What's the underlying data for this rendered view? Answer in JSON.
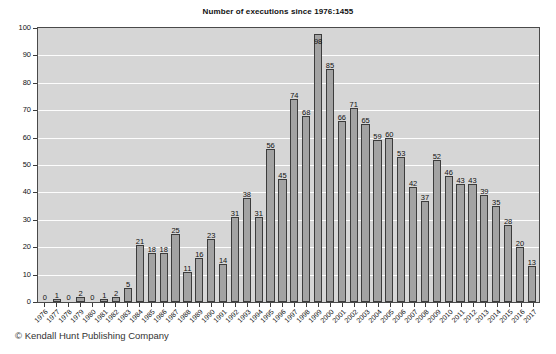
{
  "chart_data": {
    "type": "bar",
    "title": "Number of executions since 1976:1455",
    "xlabel": "",
    "ylabel": "",
    "ylim": [
      0,
      100
    ],
    "yticks": [
      0,
      10,
      20,
      30,
      40,
      50,
      60,
      70,
      80,
      90,
      100
    ],
    "grid": true,
    "legend": null,
    "categories": [
      "1976",
      "1977",
      "1978",
      "1979",
      "1980",
      "1981",
      "1982",
      "1983",
      "1984",
      "1985",
      "1986",
      "1987",
      "1988",
      "1989",
      "1990",
      "1991",
      "1992",
      "1993",
      "1994",
      "1995",
      "1996",
      "1997",
      "1998",
      "1999",
      "2000",
      "2001",
      "2002",
      "2003",
      "2004",
      "2005",
      "2006",
      "2007",
      "2008",
      "2009",
      "2010",
      "2011",
      "2012",
      "2013",
      "2014",
      "2015",
      "2016",
      "2017"
    ],
    "values": [
      0,
      1,
      0,
      2,
      0,
      1,
      2,
      5,
      21,
      18,
      18,
      25,
      11,
      16,
      23,
      14,
      31,
      38,
      31,
      56,
      45,
      74,
      68,
      98,
      85,
      66,
      71,
      65,
      59,
      60,
      53,
      42,
      37,
      52,
      46,
      43,
      43,
      39,
      35,
      28,
      20,
      13
    ],
    "bar_color": "#a3a3a3",
    "bar_border_color": "#3c3c3c",
    "plot_background": "#d6d6d6",
    "gridline_color": "#fdfdfd"
  },
  "footer": {
    "copyright": "© Kendall Hunt Publishing Company"
  }
}
